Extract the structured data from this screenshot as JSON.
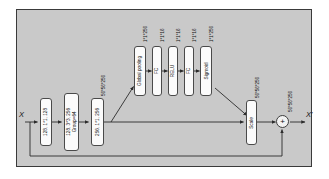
{
  "diagram": {
    "input_label": "X",
    "output_label": "X'",
    "sum_symbol": "+",
    "colors": {
      "panel_background": "#c9c9c9",
      "panel_border": "#3a3a3a",
      "box_fill": "#fbfbfb",
      "box_border": "#4a4a4a",
      "wire": "#2b2b2b",
      "text": "#141414"
    },
    "trunk_blocks": [
      {
        "line1": "128, 1*1, 128",
        "line2": ""
      },
      {
        "line1": "128, 3*3, 256",
        "line2": "Group=64"
      },
      {
        "line1": "256, 1*1, 256",
        "line2": ""
      }
    ],
    "trunk_output_caption": "56*56*256",
    "se_branch_blocks": [
      {
        "label": "Global pooling",
        "caption": "1*1*256"
      },
      {
        "label": "FC",
        "caption": "1*1*16"
      },
      {
        "label": "RELU",
        "caption": "1*1*16"
      },
      {
        "label": "FC",
        "caption": "1*1*16"
      },
      {
        "label": "Sigmoid",
        "caption": "1*1*256"
      }
    ],
    "scale_block": {
      "label": "Scale",
      "caption": "56*56*256"
    },
    "sum_caption": "56*56*256"
  }
}
